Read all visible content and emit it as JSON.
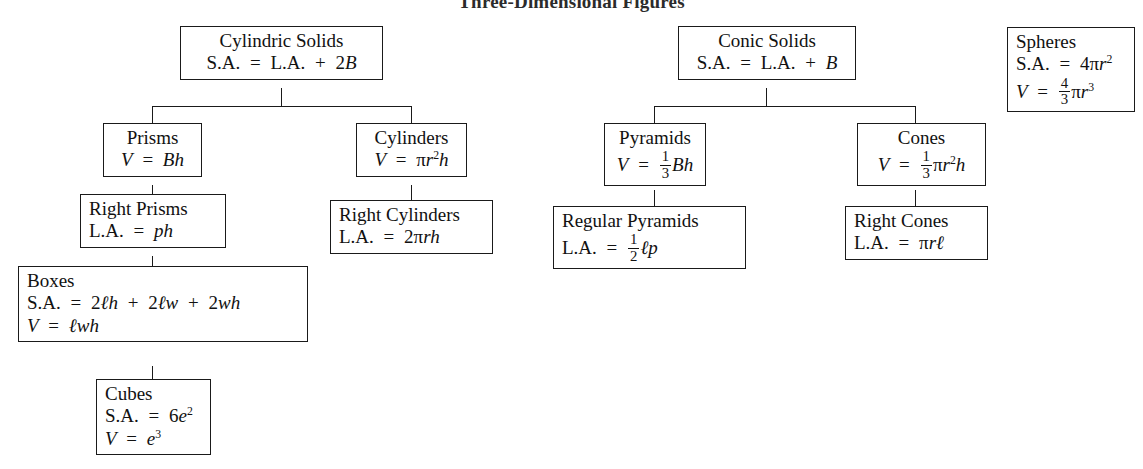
{
  "title": "Three-Dimensional Figures",
  "diagram": {
    "type": "hierarchy-tree",
    "background": "#ffffff",
    "border_color": "#1a1a1a",
    "branches": [
      {
        "root": "cylindric-solids",
        "children": [
          "prisms",
          "cylinders"
        ]
      },
      {
        "root": "conic-solids",
        "children": [
          "pyramids",
          "cones"
        ]
      },
      {
        "root": "spheres",
        "children": []
      }
    ]
  },
  "nodes": {
    "cylindric_solids": {
      "name": "Cylindric Solids",
      "formula_sa": "S.A.  =  L.A.  +  2B"
    },
    "prisms": {
      "name": "Prisms",
      "formula_v": "V  =  Bh"
    },
    "right_prisms": {
      "name": "Right Prisms",
      "formula_la": "L.A.  =  ph"
    },
    "boxes": {
      "name": "Boxes",
      "formula_sa": "S.A.  =  2ℓh  +  2ℓw  +  2wh",
      "formula_v": "V  =  ℓwh"
    },
    "cubes": {
      "name": "Cubes",
      "formula_sa": "S.A.  =  6e²",
      "formula_v": "V  =  e³"
    },
    "cylinders": {
      "name": "Cylinders",
      "formula_v": "V  =  πr²h"
    },
    "right_cylinders": {
      "name": "Right Cylinders",
      "formula_la": "L.A.  =  2πrh"
    },
    "conic_solids": {
      "name": "Conic Solids",
      "formula_sa": "S.A.  =  L.A.  +  B"
    },
    "pyramids": {
      "name": "Pyramids",
      "formula_v": "V  =  1/3 Bh"
    },
    "regular_pyramids": {
      "name": "Regular Pyramids",
      "formula_la": "L.A.  =  1/2 ℓp"
    },
    "cones": {
      "name": "Cones",
      "formula_v": "V  =  1/3 πr²h"
    },
    "right_cones": {
      "name": "Right Cones",
      "formula_la": "L.A.  =  πrℓ"
    },
    "spheres": {
      "name": "Spheres",
      "formula_sa": "S.A.  =  4πr²",
      "formula_v": "V  =  4/3 πr³"
    }
  },
  "symbols": {
    "sa_label": "S.A.",
    "la_label": "L.A.",
    "volume_label": "V",
    "equals": "=",
    "plus": "+",
    "pi": "π",
    "ell": "ℓ"
  }
}
